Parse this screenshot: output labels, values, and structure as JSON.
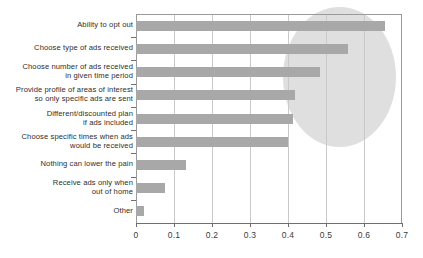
{
  "chart_data": {
    "type": "bar",
    "orientation": "horizontal",
    "title": "",
    "subtitle": "",
    "xlabel": "",
    "ylabel": "",
    "xlim": [
      0,
      0.7
    ],
    "grid": true,
    "legend": null,
    "xticks": [
      "0",
      "0.1",
      "0.2",
      "0.3",
      "0.4",
      "0.5",
      "0.6",
      "0.7"
    ],
    "xtick_values": [
      0,
      0.1,
      0.2,
      0.3,
      0.4,
      0.5,
      0.6,
      0.7
    ],
    "categories": [
      "Ability to opt out",
      "Choose type of ads received",
      "Choose number of ads received\nin given time period",
      "Provide profile of areas of interest\nso only specific ads are sent",
      "Different/discounted plan\nif ads included",
      "Choose specific times when ads\nwould be received",
      "Nothing can lower the pain",
      "Receive ads only when\nout of home",
      "Other"
    ],
    "values": [
      0.655,
      0.558,
      0.484,
      0.418,
      0.413,
      0.4,
      0.132,
      0.076,
      0.021
    ],
    "bar_color": "#a8a8a8",
    "annotations": [
      {
        "type": "ellipse-highlight",
        "color": "#d9d9d9",
        "covers_categories": [
          "Ability to opt out",
          "Choose type of ads received",
          "Choose number of ads received in given time period",
          "Provide profile of areas of interest so only specific ads are sent",
          "Different/discounted plan if ads included",
          "Choose specific times when ads would be received"
        ]
      }
    ]
  },
  "colors": {
    "bar": "#a8a8a8",
    "highlight": "#d9d9d9",
    "grid": "#c9c9c9",
    "axis": "#6f6f6f",
    "text": "#2e2e2e",
    "background": "#ffffff"
  }
}
